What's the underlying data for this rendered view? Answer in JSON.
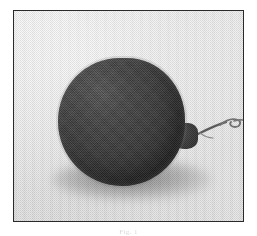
{
  "document": {
    "kind": "scanned-figure",
    "background_color": "#ffffff"
  },
  "figure": {
    "frame": {
      "border_color": "#2a2a2a",
      "background_color": "#e7e7e7",
      "x": 13,
      "y": 10,
      "width": 231,
      "height": 212
    },
    "caption": "Fig. 1",
    "subject": {
      "name": "round-dark-object",
      "description": "dark textured spherical object with a thin curled stem at the right",
      "body_color": "#3a3a3a",
      "highlight_color": "#565656",
      "shadow_color": "#3c3c3c",
      "stem_color": "#7a7a7a"
    }
  }
}
